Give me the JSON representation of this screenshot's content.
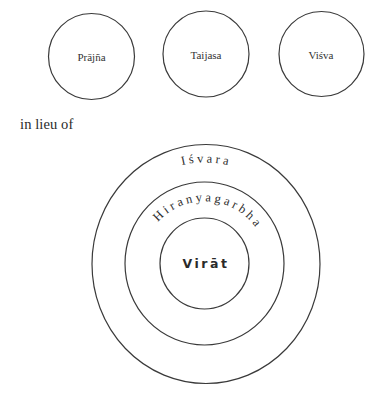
{
  "top_row": {
    "circles": [
      {
        "label": "Prājña"
      },
      {
        "label": "Taijasa"
      },
      {
        "label": "Viśva"
      }
    ]
  },
  "caption": "in lieu of",
  "concentric": {
    "outer": {
      "label": "I ś v a r a"
    },
    "middle": {
      "label": "H i r a n y a g a r b h a"
    },
    "inner": {
      "label": "Virāt"
    }
  },
  "colors": {
    "stroke": "#3a3a3a",
    "text": "#2a2a2a",
    "background": "#ffffff"
  }
}
